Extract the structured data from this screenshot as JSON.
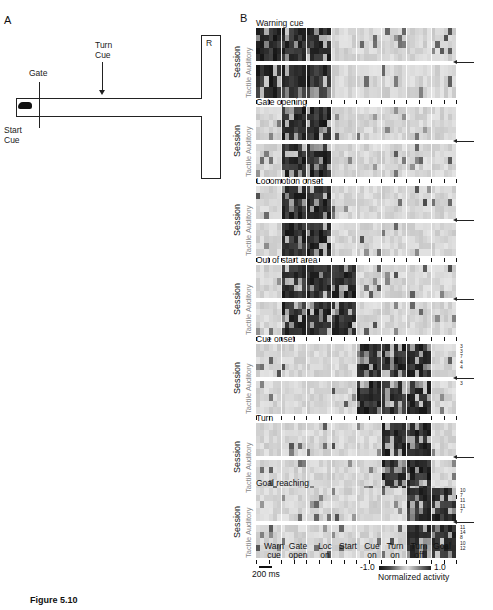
{
  "figure_caption": "Figure 5.10",
  "panel_a": {
    "letter": "A",
    "labels": {
      "turn_cue": "Turn\nCue",
      "gate": "Gate",
      "start_cue": "Start\nCue",
      "reward": "R"
    },
    "icons": [
      "rat-icon"
    ]
  },
  "panel_b": {
    "letter": "B",
    "y_label": "Session",
    "modalities": [
      "Auditory",
      "Tactile"
    ]
  },
  "chart_data": {
    "type": "heatmap",
    "xlabel": "Task epochs",
    "ylabel": "Session",
    "x_tick_labels": [
      "Warn cue",
      "Gate open",
      "Loc on",
      "Start",
      "Cue on",
      "Turn on",
      "Turn off",
      "Goal"
    ],
    "scale_bar": "200 ms",
    "colorbar": {
      "label": "Normalized activity",
      "min": -1.0,
      "max": 1.0,
      "min_label": "-1.0",
      "max_label": "1.0"
    },
    "panels": [
      {
        "title": "Warning cue",
        "peak_epochs": [
          "Warn cue",
          "Gate open",
          "Loc on"
        ],
        "rows_auditory": 5,
        "rows_tactile": 3,
        "session_labels": []
      },
      {
        "title": "Gate opening",
        "peak_epochs": [
          "Gate open",
          "Loc on"
        ],
        "rows_auditory": 5,
        "rows_tactile": 5,
        "session_labels": []
      },
      {
        "title": "Locomotion onset",
        "peak_epochs": [
          "Gate open",
          "Loc on"
        ],
        "rows_auditory": 5,
        "rows_tactile": 5,
        "session_labels": []
      },
      {
        "title": "Out of start area",
        "peak_epochs": [
          "Gate open",
          "Loc on",
          "Start"
        ],
        "rows_auditory": 5,
        "rows_tactile": 5,
        "session_labels": []
      },
      {
        "title": "Cue onset",
        "peak_epochs": [
          "Cue on",
          "Turn on",
          "Turn off"
        ],
        "rows_auditory": 5,
        "rows_tactile": 5,
        "session_labels": [
          "3",
          "3",
          "7",
          "4",
          "4",
          "3",
          "",
          "",
          "",
          ""
        ]
      },
      {
        "title": "Turn",
        "peak_epochs": [
          "Turn on",
          "Turn off"
        ],
        "rows_auditory": 5,
        "rows_tactile": 5,
        "session_labels": []
      },
      {
        "title": "Goal reaching",
        "peak_epochs": [
          "Turn off",
          "Goal"
        ],
        "rows_auditory": 5,
        "rows_tactile": 5,
        "session_labels": [
          "10",
          "7",
          "11",
          "11",
          "7",
          "11",
          "14",
          "8",
          "10",
          "12"
        ]
      }
    ]
  },
  "texts": {
    "xt0": "Warn\ncue",
    "xt1": "Gate\nopen",
    "xt2": "Loc\non",
    "xt3": "Start",
    "xt4": "Cue\non",
    "xt5": "Turn\non",
    "xt6": "Turn\noff",
    "xt7": "Goal",
    "scale": "200 ms",
    "cb_min": "-1.0",
    "cb_max": "1.0",
    "cb_label": "Normalized activity"
  }
}
